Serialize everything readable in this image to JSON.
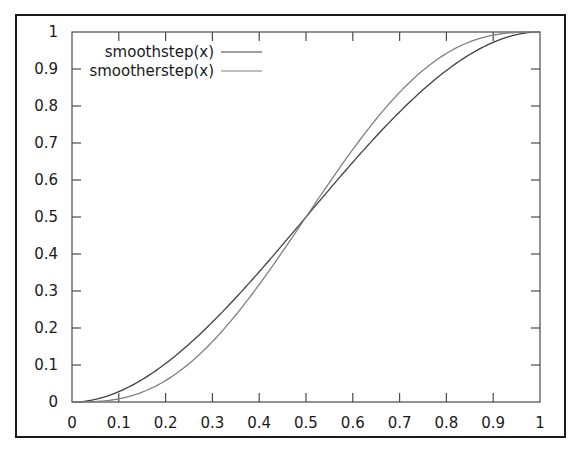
{
  "chart_data": {
    "type": "line",
    "title": "",
    "xlabel": "",
    "ylabel": "",
    "xlim": [
      0,
      1
    ],
    "ylim": [
      0,
      1
    ],
    "grid": false,
    "legend_position": "top-left (inside)",
    "x_ticks": [
      "0",
      "0.1",
      "0.2",
      "0.3",
      "0.4",
      "0.5",
      "0.6",
      "0.7",
      "0.8",
      "0.9",
      "1"
    ],
    "y_ticks": [
      "0",
      "0.1",
      "0.2",
      "0.3",
      "0.4",
      "0.5",
      "0.6",
      "0.7",
      "0.8",
      "0.9",
      "1"
    ],
    "x": [
      0,
      0.05,
      0.1,
      0.15,
      0.2,
      0.25,
      0.3,
      0.35,
      0.4,
      0.45,
      0.5,
      0.55,
      0.6,
      0.65,
      0.7,
      0.75,
      0.8,
      0.85,
      0.9,
      0.95,
      1
    ],
    "series": [
      {
        "name": "smoothstep(x)",
        "color": "#404040",
        "values": [
          0,
          0.00725,
          0.028,
          0.06075,
          0.104,
          0.15625,
          0.216,
          0.28175,
          0.352,
          0.42525,
          0.5,
          0.57475,
          0.648,
          0.71825,
          0.784,
          0.84375,
          0.896,
          0.93925,
          0.972,
          0.99275,
          1
        ]
      },
      {
        "name": "smootherstep(x)",
        "color": "#808080",
        "values": [
          0,
          0.00116,
          0.00856,
          0.02661,
          0.05792,
          0.10352,
          0.16308,
          0.23517,
          0.31744,
          0.40687,
          0.5,
          0.59313,
          0.68256,
          0.76483,
          0.83692,
          0.89648,
          0.94208,
          0.97339,
          0.99144,
          0.99884,
          1
        ]
      }
    ]
  }
}
